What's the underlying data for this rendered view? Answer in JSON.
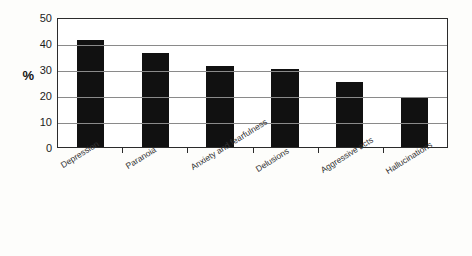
{
  "chart_data": {
    "type": "bar",
    "title": "",
    "subtitle": "",
    "xlabel": "",
    "ylabel": "%",
    "categories": [
      "Depression",
      "Paranoia",
      "Anxiety and fearfulness",
      "Delusions",
      "Aggressive acts",
      "Hallucinations"
    ],
    "values": [
      41,
      36,
      31,
      30,
      25,
      19
    ],
    "ylim": [
      0,
      50
    ],
    "yticks": [
      0,
      10,
      20,
      30,
      40,
      50
    ],
    "ytick_labels": [
      "0",
      "10",
      "20",
      "30",
      "40",
      "50"
    ],
    "grid": "horizontal",
    "legend": "none",
    "bar_color": "#111111",
    "frame_color": "#2b2b2b",
    "grid_color": "#8a8a8a",
    "background": "#fdfdfb"
  }
}
